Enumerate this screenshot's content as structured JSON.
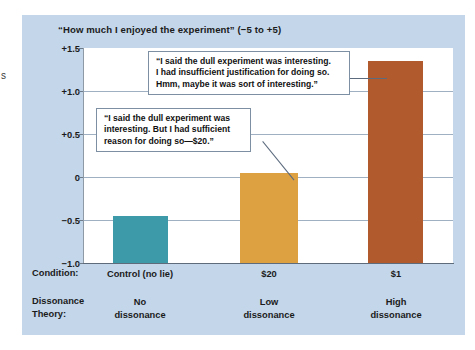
{
  "chart_data": {
    "type": "bar",
    "title": "“How much I enjoyed the experiment” (−5 to +5)",
    "xlabel": "",
    "ylabel": "",
    "ylim": [
      -1.0,
      1.5
    ],
    "grid": true,
    "legend": "none",
    "categories": [
      "Control (no lie)",
      "$20",
      "$1"
    ],
    "values": [
      -0.45,
      0.05,
      1.35
    ],
    "ytick_labels": [
      "+1.5",
      "+1.0",
      "+0.5",
      "0",
      "−0.5",
      "−1.0"
    ],
    "ytick_values": [
      1.5,
      1.0,
      0.5,
      0,
      -0.5,
      -1.0
    ],
    "bar_colors": [
      "#3d9aa8",
      "#dda142",
      "#b05a2e"
    ],
    "annotations": [
      {
        "target": "$1",
        "lines": [
          "“I said the dull experiment was interesting.",
          "I had insufficient justification for doing so.",
          "Hmm, maybe it was sort of interesting.”"
        ]
      },
      {
        "target": "$20",
        "lines": [
          "“I said the dull experiment was",
          "interesting.  But I had sufficient",
          "reason for doing so—$20.”"
        ]
      }
    ]
  },
  "axis": {
    "condition_row_label": "Condition:",
    "dissonance_row_label_line1": "Dissonance",
    "dissonance_row_label_line2": "Theory:",
    "condition_values": [
      "Control (no lie)",
      "$20",
      "$1"
    ],
    "dissonance_values": [
      {
        "line1": "No",
        "line2": "dissonance"
      },
      {
        "line1": "Low",
        "line2": "dissonance"
      },
      {
        "line1": "High",
        "line2": "dissonance"
      }
    ]
  },
  "edge_fragment": "s",
  "colors": {
    "panel_background": "#c3d6ea",
    "plot_background": "#ffffff",
    "gridline": "#9fb0c2",
    "axis": "#5d6b7a",
    "callout_border": "#7d8fa3",
    "text": "#1b1b1b"
  }
}
